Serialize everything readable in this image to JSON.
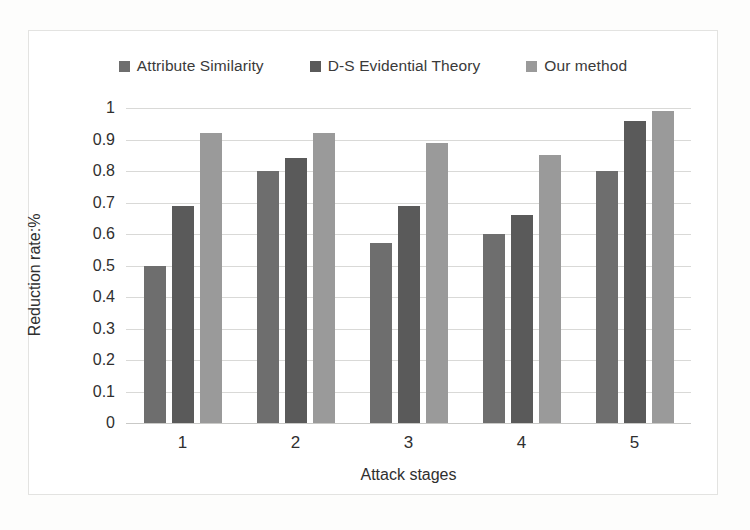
{
  "chart_data": {
    "type": "bar",
    "title": "",
    "xlabel": "Attack stages",
    "ylabel": "Reduction rate:%",
    "categories": [
      "1",
      "2",
      "3",
      "4",
      "5"
    ],
    "series": [
      {
        "name": "Attribute Similarity",
        "color": "#6e6e6e",
        "values": [
          0.5,
          0.8,
          0.57,
          0.6,
          0.8
        ]
      },
      {
        "name": "D-S Evidential Theory",
        "color": "#5a5a5a",
        "values": [
          0.69,
          0.84,
          0.69,
          0.66,
          0.96
        ]
      },
      {
        "name": "Our method",
        "color": "#9a9a9a",
        "values": [
          0.92,
          0.92,
          0.89,
          0.85,
          0.99
        ]
      }
    ],
    "ylim": [
      0,
      1
    ],
    "ytick_labels": [
      "1",
      "0.9",
      "0.8",
      "0.7",
      "0.6",
      "0.5",
      "0.4",
      "0.3",
      "0.2",
      "0.1",
      "0"
    ],
    "ytick_values": [
      1,
      0.9,
      0.8,
      0.7,
      0.6,
      0.5,
      0.4,
      0.3,
      0.2,
      0.1,
      0
    ],
    "grid": true,
    "legend_position": "top"
  }
}
